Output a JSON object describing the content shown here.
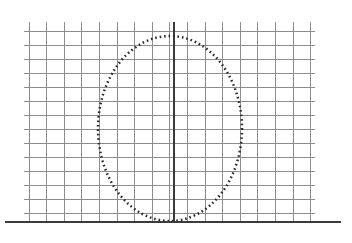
{
  "figure": {
    "width": 352,
    "height": 243,
    "background_color": "#ffffff"
  },
  "colors": {
    "grid_line": "#8d8d8d",
    "axis": "#3b3b3b",
    "curve": "#2b2b2b",
    "background": "#ffffff"
  },
  "chart_data": {
    "type": "scatter",
    "title": "",
    "subtitle": "",
    "xlabel": "",
    "ylabel": "",
    "grid": true,
    "legend": null,
    "legend_position": "none",
    "tick_labels_x": [],
    "tick_labels_y": [],
    "annotations": [],
    "axes": {
      "x_axis": {
        "name": "baseline",
        "orientation": "horizontal",
        "style": "solid-thick",
        "color": "#3b3b3b",
        "y_px": 222,
        "x_start_px": 5,
        "x_end_px": 341,
        "stroke_width_px": 2.6
      },
      "y_axis": {
        "name": "vertical-axis-of-symmetry",
        "orientation": "vertical",
        "style": "solid-thick",
        "color": "#3b3b3b",
        "x_px": 174,
        "y_start_px": 22,
        "y_end_px": 222,
        "stroke_width_px": 2.2
      }
    },
    "grid_spec": {
      "vertical_lines_count": 17,
      "vertical_first_x_px": 29,
      "vertical_spacing_px": 17.6,
      "vertical_y_top_px": 22,
      "vertical_y_bottom_px": 222,
      "horizontal_lines_count": 14,
      "horizontal_first_y_px": 31,
      "horizontal_spacing_px": 14.0,
      "horizontal_x_left_px": 24,
      "horizontal_x_right_px": 315,
      "line_color": "#8d8d8d",
      "line_width_px": 1
    },
    "series": [
      {
        "name": "dotted-ellipse",
        "style": "dotted",
        "marker": "square-dot",
        "color": "#2b2b2b",
        "stroke_width_px": 2.5,
        "dash_on_px": 1.6,
        "dash_off_px": 2.9,
        "shape": "ellipse",
        "center_x_px": 170,
        "center_y_px": 128.5,
        "radius_x_px": 72,
        "radius_y_px": 92.5,
        "left_extent_px": 98,
        "right_extent_px": 242,
        "top_extent_px": 36,
        "bottom_extent_px": 221,
        "width_in_grid_cells": 8.2,
        "height_in_grid_cells": 13.2
      }
    ]
  }
}
